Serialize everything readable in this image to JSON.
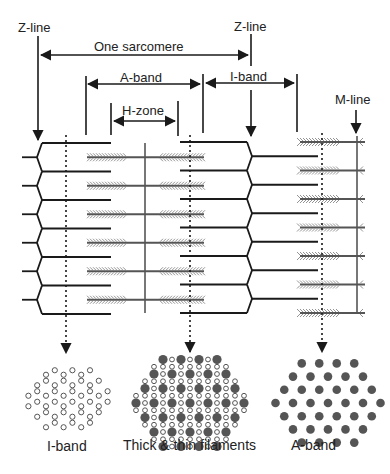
{
  "labels": {
    "z_line_left": "Z-line",
    "z_line_right": "Z-line",
    "one_sarcomere": "One sarcomere",
    "a_band_top": "A-band",
    "i_band_top": "I-band",
    "h_zone": "H-zone",
    "m_line": "M-line",
    "cross_i_band": "I-band",
    "cross_thick_thin": "Thick & thin filaments",
    "cross_a_band": "A-band"
  },
  "structure": {
    "filament_rows": 6,
    "thick_filament_rows": 6,
    "cross_section_a_band_row_counts": [
      4,
      5,
      6,
      7,
      6,
      5,
      4
    ],
    "cross_section_i_band_row_counts": [
      6,
      8,
      10,
      10,
      8,
      6
    ],
    "cross_section_overlap_thick_row_counts": [
      4,
      5,
      6,
      7,
      6,
      5,
      4
    ]
  },
  "colors": {
    "line": "#1a1a1a",
    "thick_filament": "#555555",
    "myosin_heads": "#888888",
    "thick_dot": "#555555",
    "thin_dot_stroke": "#555555"
  }
}
